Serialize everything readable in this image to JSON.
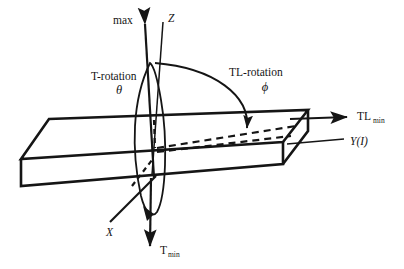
{
  "figure": {
    "type": "technical-3d-diagram",
    "background_color": "#ffffff",
    "line_color": "#151515"
  },
  "labels": {
    "max": "max",
    "z_axis": "Z",
    "x_axis": "X",
    "t_rotation_name": "T-rotation",
    "t_rotation_symbol": "θ",
    "tl_rotation_name": "TL-rotation",
    "tl_rotation_symbol": "ϕ",
    "tl_min_base": "TL",
    "tl_min_sub": "min",
    "t_min_base": "T",
    "t_min_sub": "min",
    "y_axis": "Y(I)"
  },
  "elements": {
    "slab": "rectangular-slab-3d",
    "vertical_axis_max": "upward-arrow-max",
    "vertical_axis_tmin": "downward-arrow-t-min",
    "z_axis_line": "z-axis-line",
    "x_axis_line": "x-axis-line",
    "tl_min_arrow": "tl-min-arrow-right",
    "y_pointer_line": "y-axis-pointer-line",
    "t_rotation_ellipse": "t-rotation-ellipse-path",
    "tl_rotation_arc": "tl-rotation-arc-path",
    "dashed_upper": "dashed-projection-line-upper",
    "dashed_lower": "dashed-projection-line-lower",
    "dashed_hidden_edge": "dashed-hidden-edge-lower-left",
    "dashed_vertical_segment": "dashed-vertical-axis-segment"
  }
}
